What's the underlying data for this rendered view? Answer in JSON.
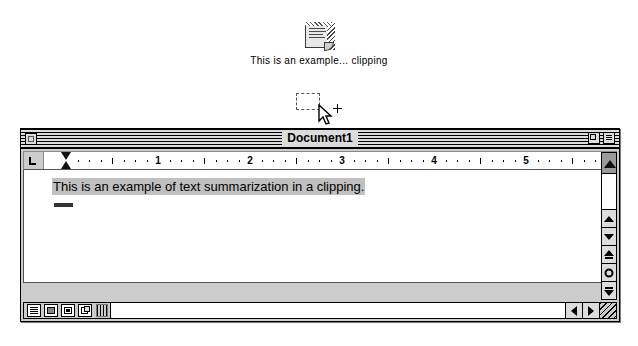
{
  "desktop": {
    "clipping": {
      "icon_name": "clipping-file-icon",
      "label": "This is an example... clipping"
    },
    "drag": {
      "ghost_name": "drag-outline",
      "cursor_name": "arrow-cursor",
      "modifier_name": "copy-plus-badge"
    }
  },
  "window": {
    "title": "Document1",
    "title_bar": {
      "close_label": "",
      "zoom_label": "",
      "collapse_label": ""
    },
    "ruler": {
      "tab_type_label": "L",
      "numbers": [
        "1",
        "2",
        "3",
        "4",
        "5"
      ],
      "unit": "inches",
      "left_indent_marker": "indent-hourglass",
      "right_indent_marker": "indent-triangle"
    },
    "document": {
      "text": "This is an example of text summarization in a clipping.",
      "selected": true,
      "selection_color": "#c0c0c0"
    },
    "scrollbars": {
      "vertical_buttons": [
        "scroll-up-button",
        "scroll-down-button",
        "page-up-button",
        "go-to-button",
        "page-down-button"
      ],
      "horizontal_buttons": [
        "scroll-left-button",
        "scroll-right-button"
      ],
      "grow_box": "resize-grow-box"
    },
    "bottom_bar": {
      "view_buttons": [
        "view-draft-button",
        "view-page-button",
        "view-layout-button",
        "view-multipage-button"
      ],
      "split_grip": "horizontal-split-grip"
    }
  },
  "colors": {
    "desktop_bg": "#ffffff",
    "window_bg": "#cccccc",
    "page_bg": "#ffffff",
    "title_stripe": "#dcdcdc",
    "selection": "#c0c0c0",
    "outline": "#000000"
  }
}
